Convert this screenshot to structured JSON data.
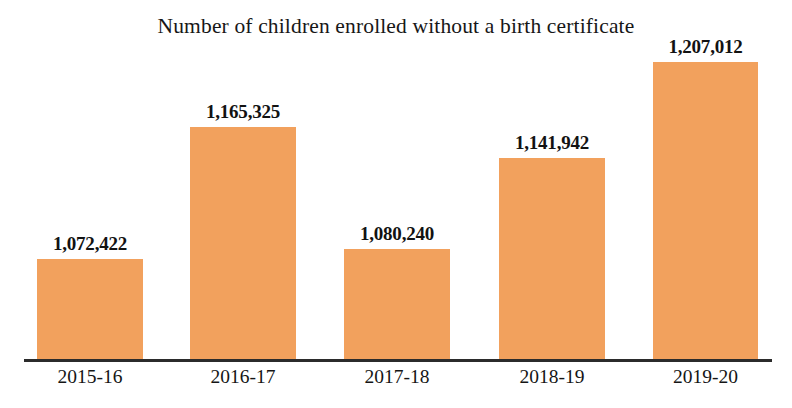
{
  "chart_data": {
    "type": "bar",
    "title": "Number of children enrolled without a birth certificate",
    "xlabel": "",
    "ylabel": "",
    "categories": [
      "2015-16",
      "2016-17",
      "2017-18",
      "2018-19",
      "2019-20"
    ],
    "values": [
      1072422,
      1165325,
      1080240,
      1141942,
      1207012
    ],
    "value_labels": [
      "1,072,422",
      "1,165,325",
      "1,080,240",
      "1,141,942",
      "1,207,012"
    ],
    "series": [
      {
        "name": "Children enrolled without a birth certificate",
        "values": [
          1072422,
          1165325,
          1080240,
          1141942,
          1207012
        ]
      }
    ],
    "bar_color": "#f2a15d",
    "axis_color": "#2b2b2b",
    "background_color": "#ffffff",
    "ylim": [
      1024000,
      1228000
    ],
    "grid": false,
    "legend": false,
    "legend_position": "none",
    "data_labels_shown": true,
    "axis_baseline_truncated": true
  },
  "chart": {
    "title": "Number of children enrolled without a birth certificate",
    "bars": [
      {
        "category": "2015-16",
        "label": "1,072,422",
        "value": 1072422,
        "left": 37,
        "width": 106,
        "height": 101
      },
      {
        "category": "2016-17",
        "label": "1,165,325",
        "value": 1165325,
        "left": 190,
        "width": 106,
        "height": 233
      },
      {
        "category": "2017-18",
        "label": "1,080,240",
        "value": 1080240,
        "left": 344,
        "width": 106,
        "height": 111
      },
      {
        "category": "2018-19",
        "label": "1,141,942",
        "value": 1141942,
        "left": 499,
        "width": 106,
        "height": 202
      },
      {
        "category": "2019-20",
        "label": "1,207,012",
        "value": 1207012,
        "left": 653,
        "width": 105,
        "height": 298
      }
    ]
  }
}
